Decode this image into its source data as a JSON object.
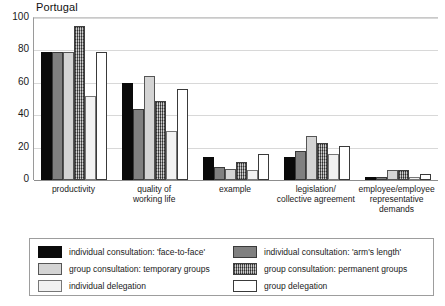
{
  "chart_data": {
    "type": "bar",
    "title": "Portugal",
    "xlabel": "",
    "ylabel": "",
    "ylim": [
      0,
      100
    ],
    "yticks": [
      0,
      20,
      40,
      60,
      80,
      100
    ],
    "grid": true,
    "legend_position": "bottom",
    "categories": [
      "productivity",
      "quality of working life",
      "example",
      "legislation/ collective agreement",
      "employee/employee representative demands"
    ],
    "category_lines": [
      [
        "productivity"
      ],
      [
        "quality of",
        "working life"
      ],
      [
        "example"
      ],
      [
        "legislation/",
        "collective agreement"
      ],
      [
        "employee/employee",
        "representative",
        "demands"
      ]
    ],
    "series": [
      {
        "name": "individual consultation: 'face-to-face'",
        "style": "fill-black",
        "values": [
          79,
          60,
          14,
          14,
          2
        ]
      },
      {
        "name": "individual consultation: 'arm's length'",
        "style": "fill-dkgray",
        "values": [
          79,
          44,
          8,
          18,
          2
        ]
      },
      {
        "name": "group consultation: temporary groups",
        "style": "fill-ltgray",
        "values": [
          79,
          64,
          7,
          27,
          6
        ]
      },
      {
        "name": "group consultation: permanent groups",
        "style": "fill-hatch",
        "values": [
          95,
          49,
          11,
          23,
          6
        ]
      },
      {
        "name": "individual delegation",
        "style": "fill-verylt",
        "values": [
          52,
          30,
          6,
          16,
          2
        ]
      },
      {
        "name": "group delegation",
        "style": "fill-white",
        "values": [
          79,
          56,
          16,
          21,
          4
        ]
      }
    ]
  },
  "legend": {
    "left_column": [
      {
        "label": "individual consultation: 'face-to-face'",
        "style": "fill-black"
      },
      {
        "label": "group consultation: temporary groups",
        "style": "fill-ltgray"
      },
      {
        "label": "individual delegation",
        "style": "fill-verylt"
      }
    ],
    "right_column": [
      {
        "label": "individual consultation: 'arm's length'",
        "style": "fill-dkgray"
      },
      {
        "label": "group consultation: permanent groups",
        "style": "fill-hatch"
      },
      {
        "label": "group delegation",
        "style": "fill-white"
      }
    ]
  },
  "colors": {
    "black": "#0a0a0a",
    "dark_gray": "#808080",
    "light_gray": "#d4d4d4",
    "hatch_gray": "#9a9a9a",
    "very_light": "#f2f2f2",
    "white": "#ffffff",
    "grid": "#d8d8d8",
    "axis": "#8d8d8d"
  }
}
